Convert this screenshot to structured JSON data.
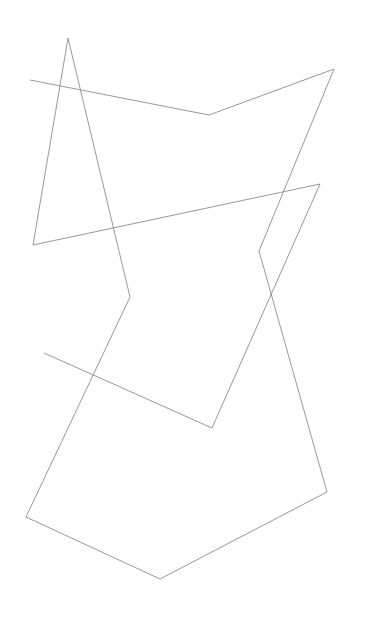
{
  "drawing": {
    "description": "Abstract single continuous line drawing of connected straight segments on a white background",
    "background_color": "#ffffff",
    "stroke_color": "#8c8c8c",
    "paths": [
      {
        "name": "continuous-line",
        "vertices": [
          [
            30,
            80
          ],
          [
            209,
            115
          ],
          [
            334,
            69
          ],
          [
            259,
            251
          ],
          [
            327,
            492
          ],
          [
            160,
            579
          ],
          [
            26,
            517
          ],
          [
            130,
            297
          ],
          [
            68,
            38
          ],
          [
            33,
            245
          ],
          [
            320,
            184
          ],
          [
            212,
            428
          ],
          [
            44,
            353
          ]
        ]
      }
    ]
  }
}
